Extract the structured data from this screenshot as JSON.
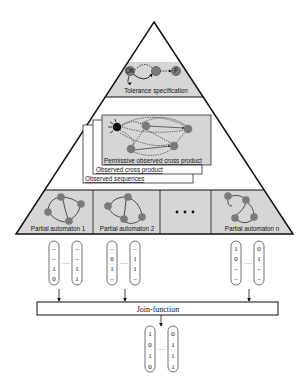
{
  "colors": {
    "band_fill": "#d6d6d6",
    "node_fill": "#7a7a7a",
    "node_dark": "#111111",
    "line": "#111111",
    "background": "#ffffff"
  },
  "pyramid": {
    "top_level": {
      "label": "Tolerance specification",
      "nodes": [
        "OK",
        "-",
        "F"
      ]
    },
    "middle_level": {
      "layers": [
        {
          "label": "Permissive observed cross product"
        },
        {
          "label": "Observed cross product"
        },
        {
          "label": "Observed sequences"
        }
      ]
    },
    "bottom_level": {
      "cells": [
        {
          "label": "Partial automaton 1"
        },
        {
          "label": "Partial automaton 2"
        },
        {
          "label": "..."
        },
        {
          "label": "Partial automaton n"
        }
      ]
    }
  },
  "vectors": {
    "group1": {
      "first": [
        "–",
        "–",
        "1",
        "0"
      ],
      "last": [
        "–",
        "–",
        "1",
        "1"
      ],
      "ellipsis": "·····"
    },
    "group2": {
      "first": [
        "–",
        "0",
        "1",
        "–"
      ],
      "last": [
        "–",
        "1",
        "1",
        "–"
      ],
      "ellipsis": "·····"
    },
    "groupn": {
      "first": [
        "1",
        "0",
        "–",
        "–"
      ],
      "last": [
        "0",
        "1",
        "–",
        "–"
      ],
      "ellipsis": "·····"
    }
  },
  "join_function": {
    "label": "Join-function"
  },
  "output_vectors": {
    "first": [
      "1",
      "0",
      "1",
      "0"
    ],
    "last": [
      "0",
      "1",
      "1",
      "1"
    ],
    "ellipsis": "·····"
  }
}
